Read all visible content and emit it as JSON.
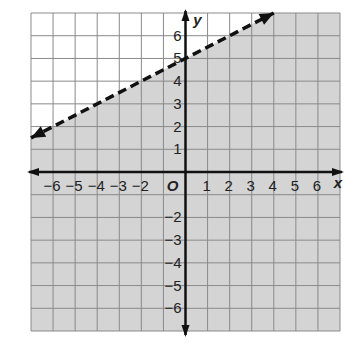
{
  "chart_data": {
    "type": "line",
    "title": "",
    "xlabel": "x",
    "ylabel": "y",
    "origin_label": "O",
    "xlim": [
      -7,
      7
    ],
    "ylim": [
      -7,
      7
    ],
    "grid": true,
    "x_ticks": [
      -6,
      -5,
      -4,
      -3,
      -2,
      1,
      2,
      3,
      4,
      5,
      6
    ],
    "y_ticks": [
      6,
      5,
      4,
      3,
      2,
      1,
      -2,
      -3,
      -4,
      -5,
      -6
    ],
    "x_tick_labels": [
      "−6",
      "−5",
      "−4",
      "−3",
      "−2",
      "1",
      "2",
      "3",
      "4",
      "5",
      "6"
    ],
    "y_tick_labels": [
      "6",
      "5",
      "4",
      "3",
      "2",
      "1",
      "−2",
      "−3",
      "−4",
      "−5",
      "−6"
    ],
    "series": [
      {
        "name": "boundary line y = 0.5x + 5",
        "style": "dashed",
        "slope": 0.5,
        "intercept": 5,
        "x": [
          -7,
          4
        ],
        "y": [
          1.5,
          7
        ]
      }
    ],
    "shaded_region": "below line (y < 0.5x + 5)",
    "colors": {
      "shade": "#d4d4d4",
      "grid": "#8a8a8a",
      "axis": "#111111",
      "line": "#111111"
    }
  }
}
